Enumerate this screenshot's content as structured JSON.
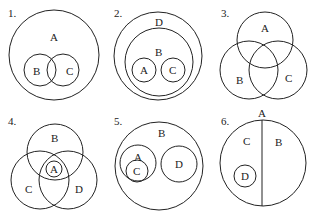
{
  "figure": {
    "panels": [
      {
        "number": "1.",
        "description": "B and C overlap, both inside A",
        "circles": [
          {
            "label": "A",
            "cx": 54,
            "cy": 55,
            "r": 45,
            "lx": 52,
            "ly": 41
          },
          {
            "label": "B",
            "cx": 40,
            "cy": 70,
            "r": 16,
            "lx": 36,
            "ly": 75
          },
          {
            "label": "C",
            "cx": 63,
            "cy": 70,
            "r": 16,
            "lx": 67,
            "ly": 75
          }
        ],
        "numX": 8,
        "numY": 17
      },
      {
        "number": "2.",
        "description": "A and C disjoint inside B, B inside D",
        "circles": [
          {
            "label": "D",
            "cx": 158,
            "cy": 56,
            "r": 44,
            "lx": 155,
            "ly": 26
          },
          {
            "label": "B",
            "cx": 159,
            "cy": 62,
            "r": 34,
            "lx": 155,
            "ly": 56
          },
          {
            "label": "A",
            "cx": 144,
            "cy": 70,
            "r": 12,
            "lx": 140,
            "ly": 74
          },
          {
            "label": "C",
            "cx": 173,
            "cy": 70,
            "r": 12,
            "lx": 169,
            "ly": 74
          }
        ],
        "numX": 114,
        "numY": 17
      },
      {
        "number": "3.",
        "description": "A, B, C mutually overlapping",
        "circles": [
          {
            "label": "A",
            "cx": 265,
            "cy": 40,
            "r": 28,
            "lx": 261,
            "ly": 32
          },
          {
            "label": "B",
            "cx": 249,
            "cy": 70,
            "r": 29,
            "lx": 236,
            "ly": 84
          },
          {
            "label": "C",
            "cx": 278,
            "cy": 70,
            "r": 29,
            "lx": 285,
            "ly": 82
          }
        ],
        "numX": 221,
        "numY": 17
      },
      {
        "number": "4.",
        "description": "B, C, D mutually overlapping; A inside intersection of all three",
        "circles": [
          {
            "label": "B",
            "cx": 55,
            "cy": 152,
            "r": 28,
            "lx": 51,
            "ly": 142
          },
          {
            "label": "C",
            "cx": 40,
            "cy": 180,
            "r": 29,
            "lx": 25,
            "ly": 193
          },
          {
            "label": "D",
            "cx": 68,
            "cy": 180,
            "r": 29,
            "lx": 75,
            "ly": 193
          },
          {
            "label": "A",
            "cx": 54,
            "cy": 169,
            "r": 8,
            "lx": 50,
            "ly": 173
          }
        ],
        "numX": 8,
        "numY": 125
      },
      {
        "number": "5.",
        "description": "C inside A; A and D disjoint, both inside B",
        "circles": [
          {
            "label": "B",
            "cx": 159,
            "cy": 166,
            "r": 44,
            "lx": 158,
            "ly": 137
          },
          {
            "label": "A",
            "cx": 138,
            "cy": 163,
            "r": 18,
            "lx": 134,
            "ly": 161
          },
          {
            "label": "C",
            "cx": 137,
            "cy": 171,
            "r": 11,
            "lx": 133,
            "ly": 175
          },
          {
            "label": "D",
            "cx": 179,
            "cy": 164,
            "r": 18,
            "lx": 175,
            "ly": 168
          }
        ],
        "numX": 114,
        "numY": 125
      },
      {
        "number": "6.",
        "description": "A split into complementary halves C and B; D inside C",
        "circles": [
          {
            "label": "A",
            "cx": 263,
            "cy": 163,
            "r": 43,
            "lx": 258,
            "ly": 117
          },
          {
            "label": "D",
            "cx": 245,
            "cy": 176,
            "r": 11,
            "lx": 241,
            "ly": 180
          }
        ],
        "divider": {
          "x1": 262,
          "y1": 120,
          "x2": 262,
          "y2": 206
        },
        "regionLabels": [
          {
            "label": "C",
            "lx": 243,
            "ly": 145
          },
          {
            "label": "B",
            "lx": 275,
            "ly": 146
          }
        ],
        "numX": 221,
        "numY": 125
      }
    ]
  }
}
